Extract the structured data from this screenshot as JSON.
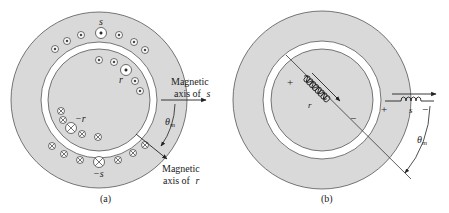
{
  "figure": {
    "colors": {
      "iron": "#d9d9d9",
      "airgap": "#ffffff",
      "stroke": "#555555",
      "ink": "#222222"
    },
    "panel_a": {
      "caption": "(a)",
      "stator_label": "s",
      "stator_neg_label": "−s",
      "rotor_label": "r",
      "rotor_neg_label": "−r",
      "axis_s_label_line1": "Magnetic",
      "axis_s_label_line2": "axis of",
      "axis_s_label_var": "s",
      "axis_r_label_line1": "Magnetic",
      "axis_r_label_line2": "axis of",
      "axis_r_label_var": "r",
      "angle_label": "θ",
      "angle_sub": "m",
      "dot_symbol": "current-out-of-page",
      "cross_symbol": "current-into-page"
    },
    "panel_b": {
      "caption": "(b)",
      "rotor_coil_label": "r",
      "stator_coil_label": "s",
      "plus": "+",
      "minus": "−",
      "angle_label": "θ",
      "angle_sub": "m"
    }
  }
}
